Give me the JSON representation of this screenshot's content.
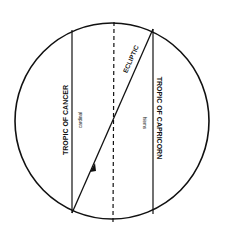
{
  "diagram": {
    "colors": {
      "ink": "#111111",
      "background": "#ffffff"
    },
    "labels": {
      "tropic_cancer": "TROPIC OF CANCER",
      "tropic_cancer_sub": "cardinal",
      "tropic_capricorn": "TROPIC OF CAPRICORN",
      "tropic_capricorn_sub": "hiems",
      "ecliptic": "ECLIPTIC"
    }
  }
}
